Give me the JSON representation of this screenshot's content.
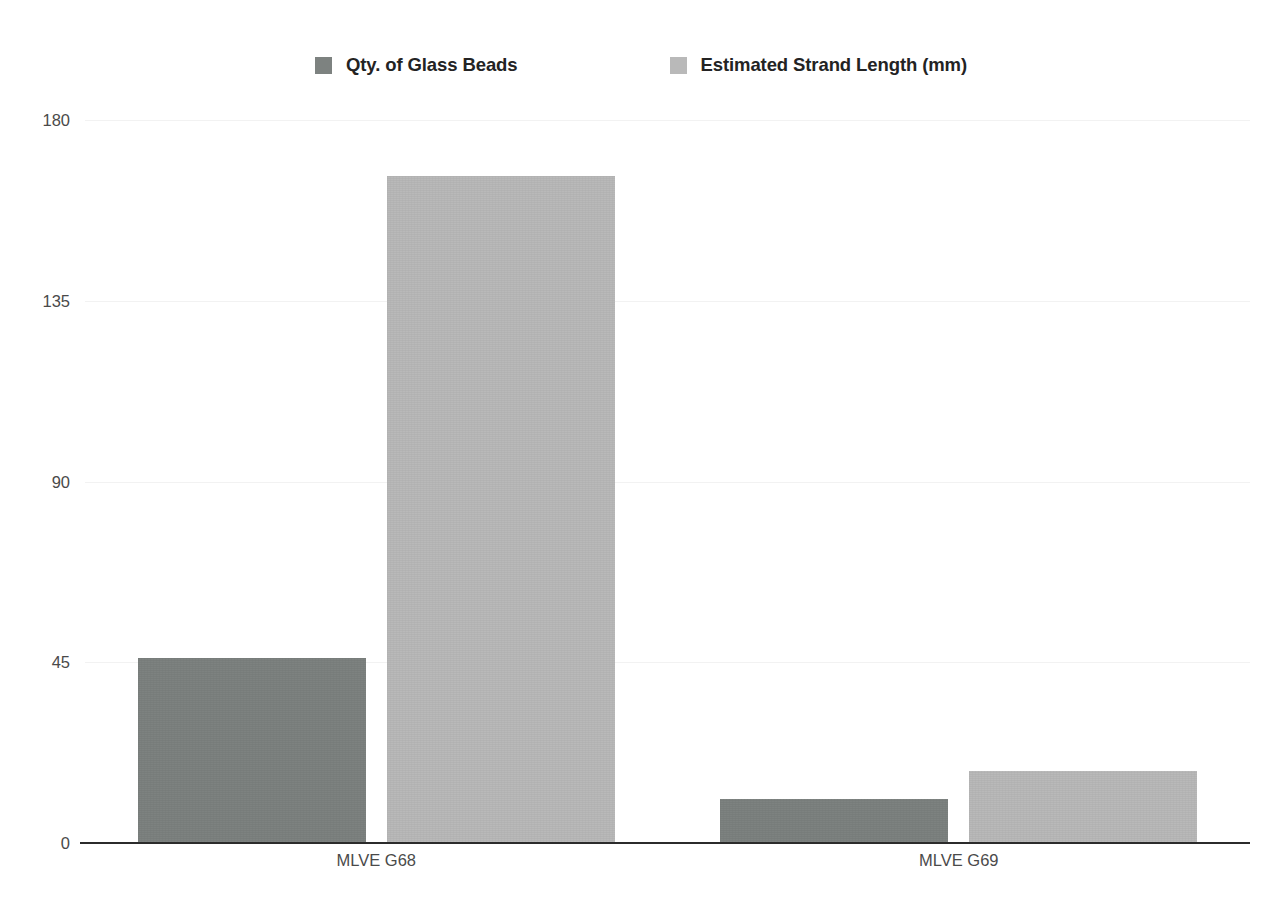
{
  "chart_data": {
    "type": "bar",
    "title": "",
    "subtitle": "",
    "xlabel": "",
    "ylabel": "",
    "categories": [
      "MLVE G68",
      "MLVE G69"
    ],
    "series": [
      {
        "name": "Qty. of Glass Beads",
        "color": "#7d8280",
        "values": [
          46,
          11
        ]
      },
      {
        "name": "Estimated Strand Length (mm)",
        "color": "#b9b9b9",
        "values": [
          166,
          18
        ]
      }
    ],
    "yticks": [
      0,
      45,
      90,
      135,
      180
    ],
    "ytick_labels": [
      "0",
      "45",
      "90",
      "135",
      "180"
    ],
    "ylim": [
      0,
      180
    ],
    "grid": true,
    "grid_color": "#f2f2f2",
    "legend_position": "top",
    "axis_color": "#2b2b2b",
    "background": "#ffffff"
  },
  "legend": {
    "items": [
      {
        "label": "Qty. of Glass Beads",
        "swatch_name": "legend-swatch-qty-of-glass-beads"
      },
      {
        "label": "Estimated Strand Length (mm)",
        "swatch_name": "legend-swatch-estimated-strand-length"
      }
    ]
  },
  "axes": {
    "y": {
      "t0": "0",
      "t1": "45",
      "t2": "90",
      "t3": "135",
      "t4": "180"
    },
    "x": {
      "c0": "MLVE G68",
      "c1": "MLVE G69"
    }
  }
}
